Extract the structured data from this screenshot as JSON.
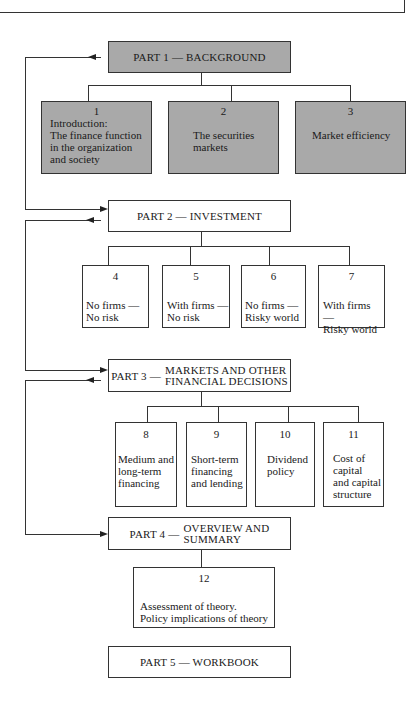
{
  "parts": {
    "p1": {
      "label": "PART 1 — BACKGROUND"
    },
    "p2": {
      "label": "PART 2 — INVESTMENT"
    },
    "p3": {
      "prefix": "PART 3 —",
      "line1": "MARKETS AND OTHER",
      "line2": "FINANCIAL DECISIONS"
    },
    "p4": {
      "prefix": "PART 4 —",
      "line1": "OVERVIEW AND",
      "line2": "SUMMARY"
    },
    "p5": {
      "label": "PART 5 — WORKBOOK"
    }
  },
  "chapters": [
    {
      "num": "1",
      "text": "Introduction:\nThe finance function\nin the organization\nand society"
    },
    {
      "num": "2",
      "text": "The securities\nmarkets"
    },
    {
      "num": "3",
      "text": "Market efficiency"
    },
    {
      "num": "4",
      "text": "No firms —\nNo risk"
    },
    {
      "num": "5",
      "text": "With firms —\nNo risk"
    },
    {
      "num": "6",
      "text": "No firms    —\nRisky world"
    },
    {
      "num": "7",
      "text": "With firms —\nRisky world"
    },
    {
      "num": "8",
      "text": "Medium and\nlong-term\nfinancing"
    },
    {
      "num": "9",
      "text": "Short-term\nfinancing\nand lending"
    },
    {
      "num": "10",
      "text": "Dividend\npolicy"
    },
    {
      "num": "11",
      "text": "Cost of\ncapital\nand capital\nstructure"
    },
    {
      "num": "12",
      "text": "Assessment of theory.\nPolicy implications of theory"
    }
  ],
  "colors": {
    "shaded_fill": "#a9a9a9",
    "line": "#333333"
  }
}
